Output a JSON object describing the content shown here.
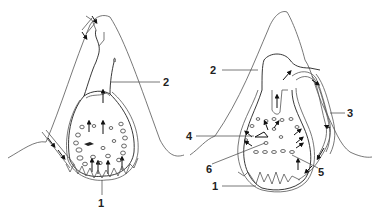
{
  "diagram": {
    "left_panel": {
      "labels": [
        {
          "id": "1",
          "text": "1"
        },
        {
          "id": "2",
          "text": "2"
        }
      ]
    },
    "right_panel": {
      "labels": [
        {
          "id": "1",
          "text": "1"
        },
        {
          "id": "2",
          "text": "2"
        },
        {
          "id": "3",
          "text": "3"
        },
        {
          "id": "4",
          "text": "4"
        },
        {
          "id": "5",
          "text": "5"
        },
        {
          "id": "6",
          "text": "6"
        }
      ]
    }
  }
}
